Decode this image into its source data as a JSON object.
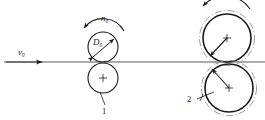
{
  "diagram": {
    "colors": {
      "stroke": "#1a1a1a",
      "strip": "#8a8a8a",
      "background": "#ffffff"
    },
    "strip": {
      "name": "workpiece-strip",
      "y": 62,
      "x_start": 4,
      "x_end": 265
    },
    "labels": {
      "velocity": {
        "text": "v",
        "sub": "0",
        "x": 18,
        "y": 52
      },
      "speed": {
        "text": "n",
        "sub": "0",
        "x": 101,
        "y": 20
      },
      "diameter": {
        "text": "D",
        "sub": "0",
        "x": 94,
        "y": 42
      },
      "item_one": {
        "text": "1",
        "x": 104,
        "y": 112
      },
      "item_two": {
        "text": "2",
        "x": 190,
        "y": 100
      }
    },
    "rollers": [
      {
        "name": "upper-left-roller",
        "cx": 103,
        "cy": 47,
        "r": 15,
        "group": "pair-1",
        "position": "upper"
      },
      {
        "name": "lower-left-roller",
        "cx": 103,
        "cy": 78,
        "r": 15,
        "group": "pair-1",
        "position": "lower"
      },
      {
        "name": "upper-right-roller",
        "cx": 227,
        "cy": 38,
        "r": 24,
        "group": "pair-2",
        "position": "upper"
      },
      {
        "name": "lower-right-roller",
        "cx": 229,
        "cy": 88,
        "r": 24,
        "group": "pair-2",
        "position": "lower"
      }
    ],
    "arrows": {
      "velocity_arrow": {
        "name": "velocity-arrow",
        "x1": 4,
        "y1": 62,
        "x2": 44,
        "y2": 62
      },
      "rotation_left": {
        "name": "rotation-arc-arrow-left",
        "direction": "counterclockwise"
      },
      "rotation_right": {
        "name": "rotation-arc-arrow-right",
        "direction": "counterclockwise"
      }
    }
  }
}
